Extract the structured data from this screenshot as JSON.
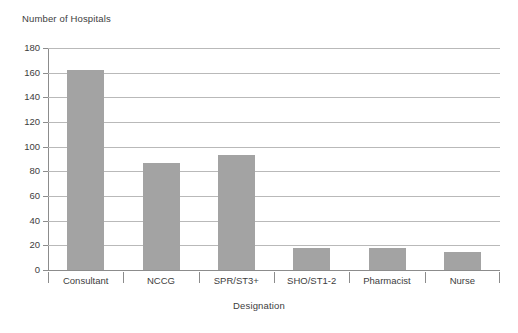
{
  "chart_data": {
    "type": "bar",
    "title": "",
    "ylabel": "Number of Hospitals",
    "xlabel": "Designation",
    "categories": [
      "Consultant",
      "NCCG",
      "SPR/ST3+",
      "SHO/ST1-2",
      "Pharmacist",
      "Nurse"
    ],
    "values": [
      162,
      87,
      93,
      18,
      18,
      15
    ],
    "ylim": [
      0,
      180
    ],
    "ytick_step": 20,
    "yticks": [
      0,
      20,
      40,
      60,
      80,
      100,
      120,
      140,
      160,
      180
    ],
    "ytick_labels": [
      "0",
      "20",
      "40",
      "60",
      "80",
      "100",
      "120",
      "140",
      "160",
      "180"
    ],
    "grid": "horizontal",
    "legend": "none",
    "bar_color": "#a3a3a3",
    "gridline_color": "#b9b9b9",
    "axis_color": "#8c8c8c",
    "text_color": "#3d3d3d",
    "background": "#ffffff"
  },
  "labels": {
    "y_axis_title": "Number of Hospitals",
    "x_axis_title": "Designation"
  }
}
